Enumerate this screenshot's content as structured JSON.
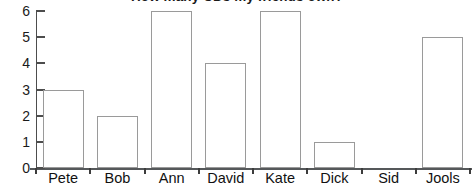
{
  "chart_data": {
    "type": "bar",
    "title": "How many CDs my friends own?",
    "xlabel": "",
    "ylabel": "",
    "categories": [
      "Pete",
      "Bob",
      "Ann",
      "David",
      "Kate",
      "Dick",
      "Sid",
      "Jools"
    ],
    "values": [
      3,
      2,
      6,
      4,
      6,
      1,
      0,
      5
    ],
    "ylim": [
      0,
      6
    ],
    "yticks": [
      0,
      1,
      2,
      3,
      4,
      5,
      6
    ],
    "ytick_labels": [
      "0",
      "1",
      "2",
      "3",
      "4",
      "5",
      "6"
    ],
    "grid": false,
    "legend": null,
    "bar_style": {
      "fill": "#ffffff",
      "stroke": "#9a9a9a"
    },
    "axis_color": "#4d4d4d",
    "text_color": "#111111"
  }
}
